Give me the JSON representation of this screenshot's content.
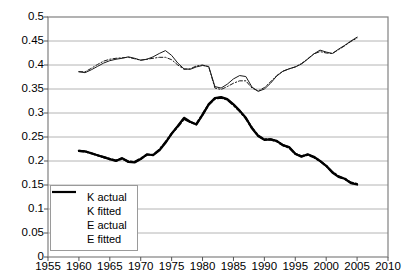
{
  "chart_data": {
    "type": "line",
    "title": "",
    "subtitle": "",
    "xlabel": "",
    "ylabel": "",
    "xlim": [
      1955,
      2010
    ],
    "ylim": [
      0,
      0.5
    ],
    "grid": true,
    "grid_axis": "y",
    "legend_position": "bottom-left",
    "x_ticks": [
      1955,
      1960,
      1965,
      1970,
      1975,
      1980,
      1985,
      1990,
      1995,
      2000,
      2005,
      2010
    ],
    "y_ticks": [
      0,
      0.05,
      0.1,
      0.15,
      0.2,
      0.25,
      0.3,
      0.35,
      0.4,
      0.45,
      0.5
    ],
    "y_tick_labels": [
      "0",
      "0.05",
      "0.1",
      "0.15",
      "0.2",
      "0.25",
      "0.3",
      "0.35",
      "0.4",
      "0.45",
      "0.5"
    ],
    "x_tick_labels": [
      "1955",
      "1960",
      "1965",
      "1970",
      "1975",
      "1980",
      "1985",
      "1990",
      "1995",
      "2000",
      "2005",
      "2010"
    ],
    "series": [
      {
        "name": "K actual",
        "style": "solid",
        "width": 1,
        "color": "#1a1a1a",
        "x": [
          1960,
          1961,
          1962,
          1963,
          1964,
          1965,
          1966,
          1967,
          1968,
          1969,
          1970,
          1971,
          1972,
          1973,
          1974,
          1975,
          1976,
          1977,
          1978,
          1979,
          1980,
          1981,
          1982,
          1983,
          1984,
          1985,
          1986,
          1987,
          1988,
          1989,
          1990,
          1991,
          1992,
          1993,
          1994,
          1995,
          1996,
          1997,
          1998,
          1999,
          2000,
          2001,
          2002,
          2003,
          2004,
          2005
        ],
        "values": [
          0.386,
          0.384,
          0.39,
          0.397,
          0.404,
          0.409,
          0.412,
          0.414,
          0.417,
          0.414,
          0.41,
          0.412,
          0.417,
          0.424,
          0.43,
          0.42,
          0.404,
          0.392,
          0.391,
          0.396,
          0.399,
          0.397,
          0.355,
          0.352,
          0.36,
          0.371,
          0.378,
          0.376,
          0.354,
          0.345,
          0.35,
          0.362,
          0.377,
          0.387,
          0.392,
          0.396,
          0.402,
          0.412,
          0.423,
          0.431,
          0.427,
          0.424,
          0.433,
          0.441,
          0.45,
          0.458
        ]
      },
      {
        "name": "K fitted",
        "style": "dashed",
        "width": 1,
        "color": "#1a1a1a",
        "x": [
          1960,
          1961,
          1962,
          1963,
          1964,
          1965,
          1966,
          1967,
          1968,
          1969,
          1970,
          1971,
          1972,
          1973,
          1974,
          1975,
          1976,
          1977,
          1978,
          1979,
          1980,
          1981,
          1982,
          1983,
          1984,
          1985,
          1986,
          1987,
          1988,
          1989,
          1990,
          1991,
          1992,
          1993,
          1994,
          1995,
          1996,
          1997,
          1998,
          1999,
          2000,
          2001,
          2002,
          2003,
          2004,
          2005
        ],
        "values": [
          0.386,
          0.386,
          0.393,
          0.401,
          0.408,
          0.412,
          0.414,
          0.415,
          0.416,
          0.413,
          0.41,
          0.412,
          0.414,
          0.416,
          0.416,
          0.411,
          0.4,
          0.391,
          0.392,
          0.398,
          0.4,
          0.396,
          0.352,
          0.349,
          0.355,
          0.362,
          0.367,
          0.367,
          0.352,
          0.346,
          0.353,
          0.365,
          0.378,
          0.387,
          0.392,
          0.396,
          0.403,
          0.413,
          0.423,
          0.428,
          0.425,
          0.424,
          0.432,
          0.44,
          0.449,
          0.456
        ]
      },
      {
        "name": "E actual",
        "style": "solid",
        "width": 2.2,
        "color": "#000000",
        "x": [
          1960,
          1961,
          1962,
          1963,
          1964,
          1965,
          1966,
          1967,
          1968,
          1969,
          1970,
          1971,
          1972,
          1973,
          1974,
          1975,
          1976,
          1977,
          1978,
          1979,
          1980,
          1981,
          1982,
          1983,
          1984,
          1985,
          1986,
          1987,
          1988,
          1989,
          1990,
          1991,
          1992,
          1993,
          1994,
          1995,
          1996,
          1997,
          1998,
          1999,
          2000,
          2001,
          2002,
          2003,
          2004,
          2005
        ],
        "values": [
          0.221,
          0.22,
          0.216,
          0.212,
          0.208,
          0.204,
          0.2,
          0.206,
          0.198,
          0.197,
          0.204,
          0.214,
          0.212,
          0.222,
          0.238,
          0.257,
          0.273,
          0.29,
          0.282,
          0.276,
          0.296,
          0.318,
          0.331,
          0.333,
          0.329,
          0.318,
          0.305,
          0.29,
          0.268,
          0.252,
          0.244,
          0.245,
          0.242,
          0.233,
          0.229,
          0.215,
          0.209,
          0.214,
          0.209,
          0.2,
          0.19,
          0.176,
          0.167,
          0.163,
          0.154,
          0.151
        ]
      },
      {
        "name": "E fitted",
        "style": "dashed",
        "width": 2.2,
        "color": "#000000",
        "x": [
          1960,
          1961,
          1962,
          1963,
          1964,
          1965,
          1966,
          1967,
          1968,
          1969,
          1970,
          1971,
          1972,
          1973,
          1974,
          1975,
          1976,
          1977,
          1978,
          1979,
          1980,
          1981,
          1982,
          1983,
          1984,
          1985,
          1986,
          1987,
          1988,
          1989,
          1990,
          1991,
          1992,
          1993,
          1994,
          1995,
          1996,
          1997,
          1998,
          1999,
          2000,
          2001,
          2002,
          2003,
          2004,
          2005
        ],
        "values": [
          0.221,
          0.22,
          0.216,
          0.212,
          0.208,
          0.204,
          0.201,
          0.205,
          0.199,
          0.198,
          0.205,
          0.213,
          0.213,
          0.223,
          0.239,
          0.257,
          0.272,
          0.288,
          0.281,
          0.277,
          0.297,
          0.318,
          0.33,
          0.332,
          0.328,
          0.317,
          0.304,
          0.289,
          0.269,
          0.253,
          0.245,
          0.245,
          0.241,
          0.233,
          0.228,
          0.215,
          0.21,
          0.213,
          0.208,
          0.2,
          0.19,
          0.177,
          0.168,
          0.163,
          0.155,
          0.152
        ]
      }
    ],
    "legend": [
      {
        "label": "K actual",
        "style": "solid",
        "width": 1
      },
      {
        "label": "K fitted",
        "style": "dashed",
        "width": 1
      },
      {
        "label": "E actual",
        "style": "solid",
        "width": 2.2
      },
      {
        "label": "E fitted",
        "style": "dashed",
        "width": 2.2
      }
    ],
    "colors": {
      "grid": "#b4b4b4",
      "frame": "#808080",
      "axis_text": "#000000",
      "background": "#ffffff",
      "legend_border": "#9a9a9a"
    },
    "geometry": {
      "plot_left": 48,
      "plot_right": 388,
      "plot_top": 17,
      "plot_bottom": 257,
      "legend_left": 50,
      "legend_top": 185,
      "legend_width": 88,
      "legend_height": 66
    }
  }
}
